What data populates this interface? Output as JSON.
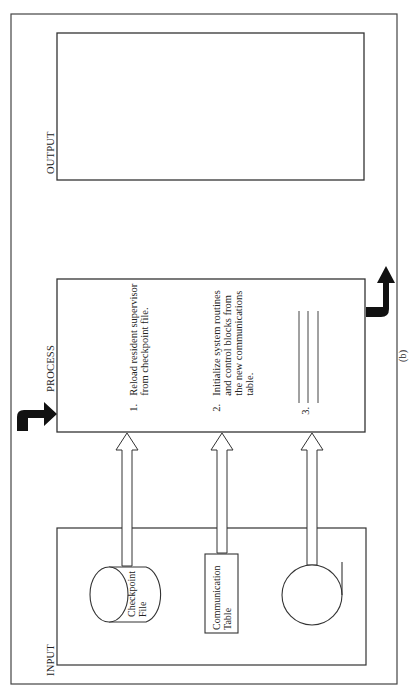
{
  "diagram": {
    "caption": "(b)",
    "sections": {
      "output": {
        "label": "OUTPUT"
      },
      "process": {
        "label": "PROCESS",
        "steps": [
          {
            "number": "1.",
            "text": "Reload resident supervisor\nfrom checkpoint file."
          },
          {
            "number": "2.",
            "text": "Initialize system routines\nand control blocks from\nthe new communications\ntable."
          },
          {
            "number": "3.",
            "text": ""
          }
        ]
      },
      "input": {
        "label": "INPUT",
        "items": [
          {
            "shape": "disk-cylinder",
            "label": "Checkpoint\nFile"
          },
          {
            "shape": "rectangle",
            "label": "Communication\nTable"
          },
          {
            "shape": "tape-reel",
            "label": ""
          }
        ]
      }
    },
    "arrows": {
      "entry": "bent-arrow-into-process",
      "exit": "bent-arrow-out-of-process",
      "input_to_process": 3
    },
    "colors": {
      "line": "#333333",
      "fill_arrow": "#111111",
      "background": "#ffffff"
    }
  }
}
